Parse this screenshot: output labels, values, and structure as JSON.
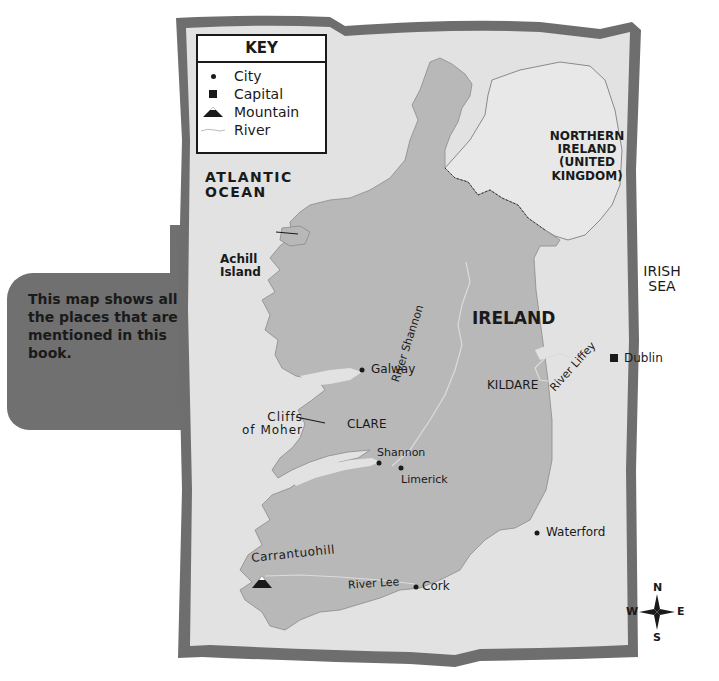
{
  "callout": {
    "text": "This map shows all the places that are mentioned in this book."
  },
  "key": {
    "title": "KEY",
    "items": [
      {
        "symbol": "dot-icon",
        "label": "City"
      },
      {
        "symbol": "square-icon",
        "label": "Capital"
      },
      {
        "symbol": "mountain-icon",
        "label": "Mountain"
      },
      {
        "symbol": "river-line-icon",
        "label": "River"
      }
    ]
  },
  "regions": {
    "ocean": "ATLANTIC\nOCEAN",
    "ocean_line1": "ATLANTIC",
    "ocean_line2": "OCEAN",
    "sea_line1": "IRISH",
    "sea_line2": "SEA",
    "country": "IRELAND",
    "ni_line1": "NORTHERN",
    "ni_line2": "IRELAND",
    "ni_line3": "(UNITED",
    "ni_line4": "KINGDOM)",
    "county_kildare": "KILDARE",
    "county_clare": "CLARE"
  },
  "places": {
    "achill_line1": "Achill",
    "achill_line2": "Island",
    "galway": "Galway",
    "dublin": "Dublin",
    "cliffs_line1": "Cliffs",
    "cliffs_line2": "of Moher",
    "shannon": "Shannon",
    "limerick": "Limerick",
    "waterford": "Waterford",
    "cork": "Cork",
    "carrantuohill": "Carrantuohill"
  },
  "rivers": {
    "shannon": "River Shannon",
    "liffey": "River Liffey",
    "lee": "River Lee"
  },
  "compass": {
    "n": "N",
    "s": "S",
    "e": "E",
    "w": "W"
  },
  "colors": {
    "frame": "#6e6e6e",
    "sea": "#e2e2e2",
    "land_ireland": "#b8b8b8",
    "land_ni": "#e8e8e8",
    "callout_bg": "#707070",
    "text": "#1a1a1a"
  }
}
